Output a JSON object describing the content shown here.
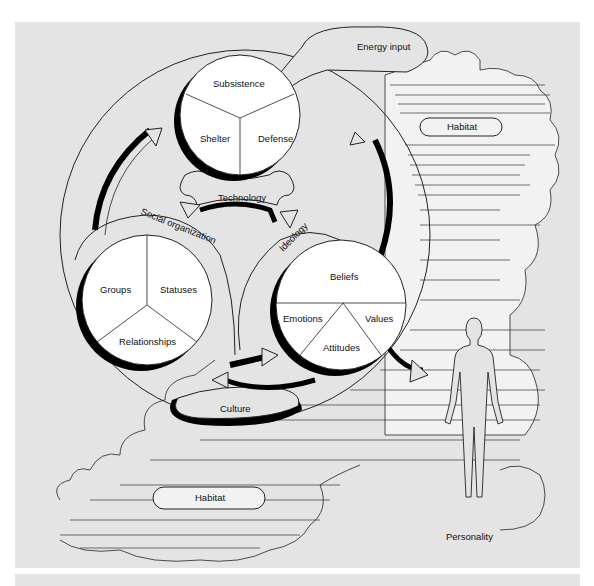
{
  "diagram": {
    "energy_input": "Energy input",
    "habitat_top": "Habitat",
    "habitat_bottom": "Habitat",
    "personality": "Personality",
    "culture": "Culture",
    "technology": "Technology",
    "social_organization": "Social organization",
    "ideology": "Ideology",
    "technology_circle": {
      "segments": [
        "Subsistence",
        "Shelter",
        "Defense"
      ]
    },
    "social_circle": {
      "segments": [
        "Groups",
        "Statuses",
        "Relationships"
      ]
    },
    "ideology_circle": {
      "segments": [
        "Beliefs",
        "Emotions",
        "Values",
        "Attitudes"
      ]
    }
  },
  "colors": {
    "background": "#e4e4e4",
    "circle_fill": "#ffffff",
    "shadow": "#000000",
    "line": "#111111"
  }
}
